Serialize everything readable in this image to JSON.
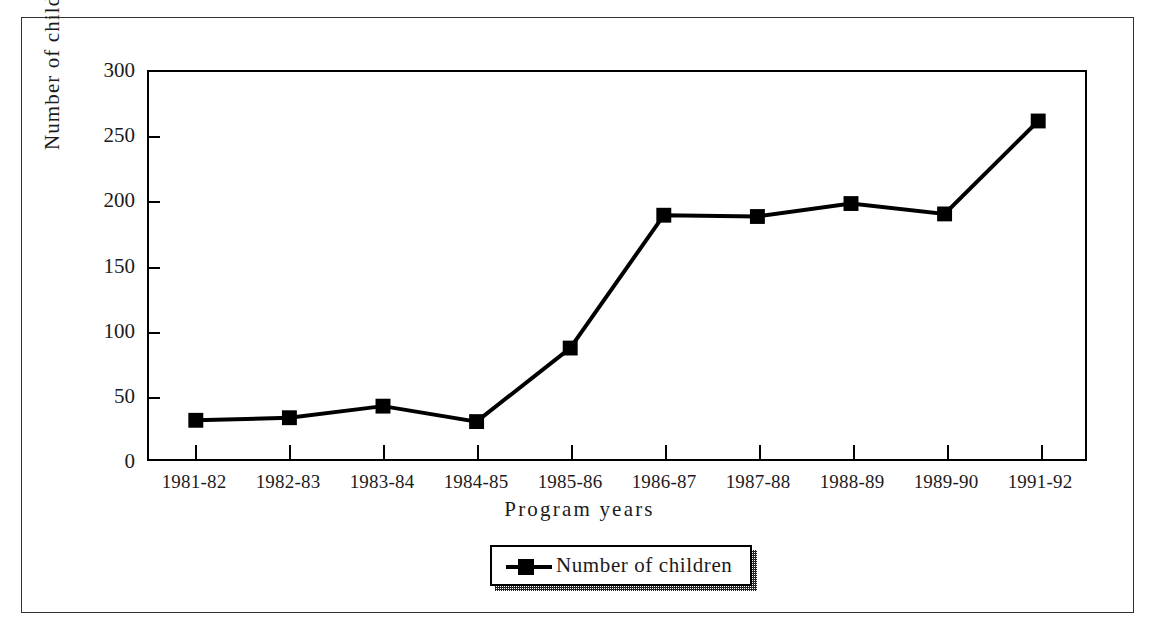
{
  "chart_data": {
    "type": "line",
    "title": "",
    "xlabel": "Program years",
    "ylabel": "Number of children",
    "categories": [
      "1981-82",
      "1982-83",
      "1983-84",
      "1984-85",
      "1985-86",
      "1986-87",
      "1987-88",
      "1988-89",
      "1989-90",
      "1991-92"
    ],
    "series": [
      {
        "name": "Number of children",
        "values": [
          30,
          32,
          41,
          29,
          86,
          189,
          188,
          198,
          190,
          262
        ]
      }
    ],
    "ylim": [
      0,
      300
    ],
    "yticks": [
      0,
      50,
      100,
      150,
      200,
      250,
      300
    ],
    "ytick_labels": [
      "0",
      "50",
      "100",
      "150",
      "200",
      "250",
      "300"
    ],
    "grid": false,
    "legend_position": "bottom-center",
    "marker": "filled-square",
    "line_color": "#000000",
    "marker_color": "#000000",
    "axis_color": "#000000",
    "background_color": "#ffffff"
  },
  "legend": {
    "entries": [
      {
        "label": "Number of children",
        "marker": "filled-square-marker",
        "color": "#000000"
      }
    ]
  },
  "frame": {
    "outer_border_color": "#33322f",
    "plot_border_color": "#000000"
  }
}
